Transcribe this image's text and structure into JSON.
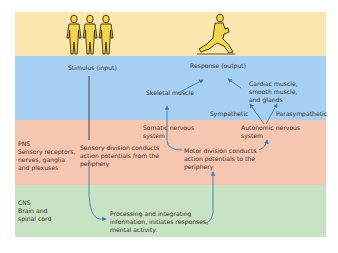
{
  "colors": {
    "top_band": "#fbe6ad",
    "effector_band": "#a6d0f3",
    "pns_band": "#f7c6b0",
    "cns_band": "#c8e2c4",
    "arrow": "#3f78b5",
    "figure_fill": "#f3d54a",
    "figure_stroke": "#3a2a12"
  },
  "icons": {
    "stimulus": "three-standing-people-icon",
    "response": "lunging-person-icon"
  },
  "top": {
    "stimulus_label": "Stimulus (input)",
    "response_label": "Response (output)"
  },
  "effectors": {
    "skeletal_muscle": "Skeletal muscle",
    "cardiac_line1": "Cardiac muscle,",
    "cardiac_line2": "smooth muscle,",
    "cardiac_line3": "and glands",
    "sympathetic": "Sympathetic",
    "parasympathetic": "Parasympathetic"
  },
  "pns": {
    "title": "PNS",
    "desc_line1": "Sensory receptors,",
    "desc_line2": "nerves, ganglia",
    "desc_line3": "and plexuses",
    "sensory_line1": "Sensory division conducts",
    "sensory_line2": "action potentials from the",
    "sensory_line3": "periphery",
    "somatic_line1": "Somatic nervous",
    "somatic_line2": "system",
    "autonomic_line1": "Autonomic nervous",
    "autonomic_line2": "system",
    "motor_line1": "Motor division conducts",
    "motor_line2": "action potentials to the",
    "motor_line3": "periphery"
  },
  "cns": {
    "title": "CNS",
    "desc_line1": "Brain and",
    "desc_line2": "spinal cord",
    "processing_line1": "Processing and integrating",
    "processing_line2": "information, initiates responses,",
    "processing_line3": "mental activity"
  }
}
